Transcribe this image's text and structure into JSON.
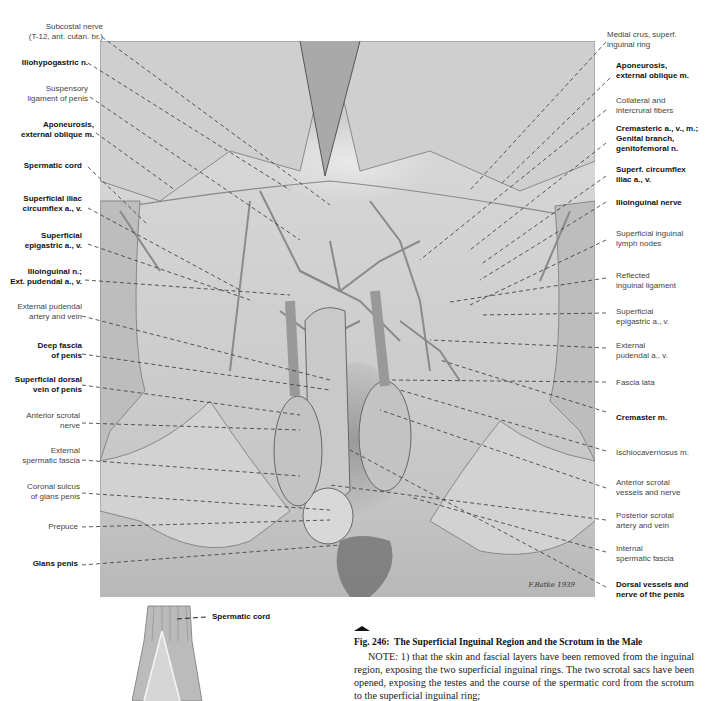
{
  "figure": {
    "number": "Fig. 246:",
    "title": "The Superficial Inguinal Region and the Scrotum in the Male",
    "signature": "F.Batke 1939",
    "note": "NOTE:  1) that the skin and fascial layers have been removed from the inguinal region, exposing the two superficial inguinal rings. The two scrotal sacs have been opened, exposing the testes and the course of the spermatic cord from the scrotum to the superficial inguinal ring;"
  },
  "labels_left": [
    {
      "text": "Subcostal nerve\n(T-12, ant. cutan. br.)",
      "bold": false
    },
    {
      "text": "Iliohypogastric n.",
      "bold": true
    },
    {
      "text": "Suspensory\nligament of penis",
      "bold": false
    },
    {
      "text": "Aponeurosis,\nexternal oblique m.",
      "bold": true
    },
    {
      "text": "Spermatic cord",
      "bold": true
    },
    {
      "text": "Superficial iliac\ncircumflex a., v.",
      "bold": true
    },
    {
      "text": "Superficial\nepigastric a., v.",
      "bold": true
    },
    {
      "text": "Ilioinguinal n.;\nExt. pudendal a., v.",
      "bold": true
    },
    {
      "text": "External pudendal\nartery and vein",
      "bold": false
    },
    {
      "text": "Deep fascia\nof penis",
      "bold": true
    },
    {
      "text": "Superficial dorsal\nvein of penis",
      "bold": true
    },
    {
      "text": "Anterior scrotal\nnerve",
      "bold": false
    },
    {
      "text": "External\nspermatic fascia",
      "bold": false
    },
    {
      "text": "Coronal sulcus\nof glans penis",
      "bold": false
    },
    {
      "text": "Prepuce",
      "bold": false
    },
    {
      "text": "Glans penis",
      "bold": true
    }
  ],
  "labels_right": [
    {
      "text": "Medial crus, superf.\ninguinal ring",
      "bold": false
    },
    {
      "text": "Aponeurosis,\nexternal oblique m.",
      "bold": true
    },
    {
      "text": "Collateral and\nintercrural fibers",
      "bold": false
    },
    {
      "text": "Cremasteric a., v., m.;\nGenital branch,\ngenitofemoral n.",
      "bold": true
    },
    {
      "text": "Superf. circumflex\niliac a., v.",
      "bold": true
    },
    {
      "text": "Ilioinguinal nerve",
      "bold": true
    },
    {
      "text": "Superficial inguinal\nlymph nodes",
      "bold": false
    },
    {
      "text": "Reflected\ninguinal ligament",
      "bold": false
    },
    {
      "text": "Superficial\nepigastric a., v.",
      "bold": false
    },
    {
      "text": "External\npudendal a., v.",
      "bold": false
    },
    {
      "text": "Fascia lata",
      "bold": false
    },
    {
      "text": "Cremaster m.",
      "bold": true
    },
    {
      "text": "Ischiocavernosus m.",
      "bold": false
    },
    {
      "text": "Anterior scrotal\nvessels and nerve",
      "bold": false
    },
    {
      "text": "Posterior scrotal\nartery and vein",
      "bold": false
    },
    {
      "text": "Internal\nspermatic fascia",
      "bold": false
    },
    {
      "text": "Dorsal vessels and\nnerve of the penis",
      "bold": true
    }
  ],
  "inset": {
    "label": "Spermatic cord"
  }
}
